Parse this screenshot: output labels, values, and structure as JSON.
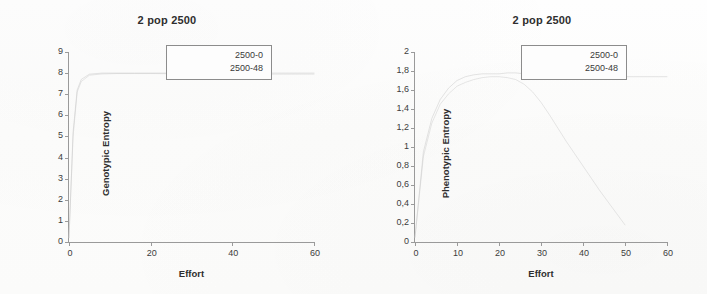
{
  "document": {
    "kind": "scanned-figure-pair",
    "background_color": "#fdfdfc",
    "axis_color": "#9a9a9a",
    "text_color": "#3a3a3a"
  },
  "charts": [
    {
      "id": "genotypic",
      "title": "2 pop 2500",
      "xlabel": "Effort",
      "ylabel": "Genotypic Entropy",
      "legend": [
        "2500-0",
        "2500-48"
      ],
      "xticks": [
        "0",
        "20",
        "40",
        "60"
      ],
      "yticks": [
        "0",
        "1",
        "2",
        "3",
        "4",
        "5",
        "6",
        "7",
        "8",
        "9"
      ]
    },
    {
      "id": "phenotypic",
      "title": "2 pop 2500",
      "xlabel": "Effort",
      "ylabel": "Phenotypic Entropy",
      "legend": [
        "2500-0",
        "2500-48"
      ],
      "xticks": [
        "0",
        "10",
        "20",
        "30",
        "40",
        "50",
        "60"
      ],
      "yticks": [
        "0",
        "0,2",
        "0,4",
        "0,6",
        "0,8",
        "1",
        "1,2",
        "1,4",
        "1,6",
        "1,8",
        "2"
      ]
    }
  ],
  "chart_data": [
    {
      "type": "line",
      "title": "2 pop 2500",
      "xlabel": "Effort",
      "ylabel": "Genotypic Entropy",
      "xlim": [
        0,
        60
      ],
      "ylim": [
        0,
        9
      ],
      "xticks": [
        0,
        20,
        40,
        60
      ],
      "yticks": [
        0,
        1,
        2,
        3,
        4,
        5,
        6,
        7,
        8,
        9
      ],
      "grid": false,
      "legend": [
        "2500-0",
        "2500-48"
      ],
      "legend_position": "upper-right-inside",
      "line_color": "#c9c9c9",
      "series": [
        {
          "name": "2500-0",
          "x": [
            0,
            1,
            2,
            3,
            5,
            8,
            12,
            16,
            20,
            25,
            30,
            35,
            40,
            45,
            50,
            55,
            60
          ],
          "values": [
            0.2,
            5.2,
            7.2,
            7.7,
            7.95,
            8.0,
            8.0,
            8.0,
            8.0,
            8.0,
            8.0,
            8.0,
            8.0,
            8.0,
            8.0,
            8.0,
            8.0
          ]
        },
        {
          "name": "2500-48",
          "x": [
            0,
            1,
            2,
            3,
            5,
            8,
            12,
            16,
            20,
            25,
            30,
            35,
            40,
            45,
            50,
            55,
            60
          ],
          "values": [
            0.2,
            5.0,
            7.1,
            7.6,
            7.9,
            7.96,
            7.98,
            7.98,
            7.98,
            7.97,
            7.97,
            7.96,
            7.96,
            7.95,
            7.95,
            7.95,
            7.95
          ]
        }
      ]
    },
    {
      "type": "line",
      "title": "2 pop 2500",
      "xlabel": "Effort",
      "ylabel": "Phenotypic Entropy",
      "xlim": [
        0,
        60
      ],
      "ylim": [
        0,
        2
      ],
      "xticks": [
        0,
        10,
        20,
        30,
        40,
        50,
        60
      ],
      "yticks": [
        0,
        0.2,
        0.4,
        0.6,
        0.8,
        1,
        1.2,
        1.4,
        1.6,
        1.8,
        2
      ],
      "grid": false,
      "legend": [
        "2500-0",
        "2500-48"
      ],
      "legend_position": "upper-right-inside",
      "line_color": "#c9c9c9",
      "series": [
        {
          "name": "2500-0",
          "x": [
            0,
            2,
            4,
            6,
            8,
            10,
            12,
            14,
            16,
            18,
            20,
            22,
            24,
            26,
            28,
            30,
            32,
            34,
            36,
            38,
            40,
            42,
            44,
            46,
            48,
            50,
            52,
            55,
            58,
            60
          ],
          "values": [
            0.05,
            0.95,
            1.3,
            1.5,
            1.62,
            1.7,
            1.74,
            1.76,
            1.77,
            1.77,
            1.77,
            1.78,
            1.78,
            1.77,
            1.77,
            1.78,
            1.78,
            1.77,
            1.76,
            1.75,
            1.74,
            1.73,
            1.74,
            1.73,
            1.73,
            1.74,
            1.74,
            1.74,
            1.74,
            1.74
          ]
        },
        {
          "name": "2500-48",
          "x": [
            0,
            2,
            4,
            6,
            8,
            10,
            12,
            14,
            16,
            18,
            20,
            22,
            24,
            26,
            28,
            30,
            32,
            34,
            36,
            38,
            40,
            42,
            44,
            46,
            48,
            50
          ],
          "values": [
            0.05,
            0.9,
            1.25,
            1.45,
            1.56,
            1.64,
            1.68,
            1.71,
            1.73,
            1.74,
            1.74,
            1.73,
            1.71,
            1.66,
            1.58,
            1.47,
            1.34,
            1.2,
            1.06,
            0.93,
            0.8,
            0.67,
            0.54,
            0.42,
            0.3,
            0.18
          ]
        }
      ]
    }
  ]
}
